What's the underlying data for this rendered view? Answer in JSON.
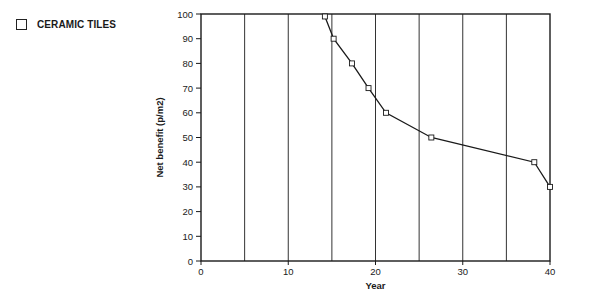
{
  "legend": {
    "items": [
      {
        "label": "CERAMIC TILES",
        "marker": "open-square"
      }
    ]
  },
  "axes": {
    "xlabel": "Year",
    "ylabel": "Net benefit (p/m2)",
    "xticks": [
      "0",
      "10",
      "20",
      "30",
      "40"
    ],
    "yticks": [
      "0",
      "10",
      "20",
      "30",
      "40",
      "50",
      "60",
      "70",
      "80",
      "90",
      "100"
    ]
  },
  "colors": {
    "line": "#1a1a1a",
    "grid": "#333333",
    "background": "#ffffff"
  },
  "chart_data": {
    "type": "line",
    "title": "",
    "xlabel": "Year",
    "ylabel": "Net benefit (p/m2)",
    "xlim": [
      0,
      40
    ],
    "ylim": [
      0,
      100
    ],
    "grid": "vertical lines every 5 years",
    "legend_position": "top-left, outside plot",
    "series": [
      {
        "name": "CERAMIC TILES",
        "marker": "open-square",
        "x": [
          14.2,
          15.2,
          17.3,
          19.2,
          21.2,
          26.4,
          38.2,
          40
        ],
        "y": [
          99,
          90,
          80,
          70,
          60,
          50,
          40,
          30
        ]
      }
    ]
  }
}
